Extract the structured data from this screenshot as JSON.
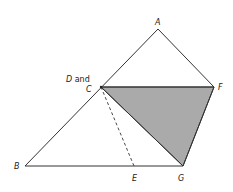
{
  "diagram": {
    "points": {
      "A": {
        "x": 158,
        "y": 29
      },
      "C": {
        "x": 101,
        "y": 87
      },
      "F": {
        "x": 214,
        "y": 87
      },
      "B": {
        "x": 25,
        "y": 166
      },
      "E": {
        "x": 134,
        "y": 166
      },
      "G": {
        "x": 183,
        "y": 166
      }
    },
    "labels": {
      "A": "A",
      "D_and": "D and",
      "C": "C",
      "F": "F",
      "B": "B",
      "E": "E",
      "G": "G"
    },
    "colors": {
      "stroke": "#333333",
      "shade": "#aaaaaa"
    },
    "shaded_triangle": "CFG",
    "dashed_segment": "CE"
  }
}
